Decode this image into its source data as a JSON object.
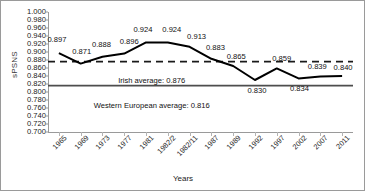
{
  "chart_data": {
    "type": "line",
    "title": "",
    "xlabel": "Years",
    "ylabel": "sPSNS",
    "categories": [
      "1965",
      "1969",
      "1973",
      "1977",
      "1981",
      "1982/2",
      "1982/11",
      "1987",
      "1989",
      "1992",
      "1997",
      "2002",
      "2007",
      "2011"
    ],
    "values": [
      0.897,
      0.871,
      0.888,
      0.896,
      0.924,
      0.924,
      0.913,
      0.883,
      0.865,
      0.83,
      0.859,
      0.834,
      0.839,
      0.84
    ],
    "data_labels": [
      "0.897",
      "0.871",
      "0.888",
      "0.896",
      "0.924",
      "0.924",
      "0.913",
      "0.883",
      "0.865",
      "0.830",
      "0.859",
      "0.834",
      "0.839",
      "0.840"
    ],
    "ylim": [
      0.7,
      1.0
    ],
    "ytick_step": 0.02,
    "ytick_labels": [
      "1.000",
      "0.980",
      "0.960",
      "0.940",
      "0.920",
      "0.900",
      "0.880",
      "0.860",
      "0.840",
      "0.820",
      "0.800",
      "0.780",
      "0.760",
      "0.740",
      "0.720",
      "0.700"
    ],
    "grid": false,
    "legend": "none",
    "series_color": "#000000",
    "reference_lines": [
      {
        "name": "irish-average",
        "label": "Irish average: 0.876",
        "value": 0.876,
        "style": "dashed",
        "color": "#1a1a1a"
      },
      {
        "name": "western-european-average",
        "label": "Western European average: 0.816",
        "value": 0.816,
        "style": "solid",
        "color": "#4d4d4d"
      }
    ]
  }
}
